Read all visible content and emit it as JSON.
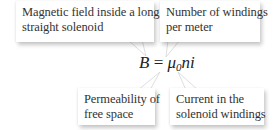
{
  "diagram": {
    "formula": {
      "lhs": "B",
      "equals": " = ",
      "mu": "μ",
      "mu_sub": "0",
      "rest": "ni"
    },
    "callouts": [
      {
        "id": "magnetic-field",
        "lines": [
          "Magnetic field inside a long,",
          "straight solenoid"
        ],
        "points_to": "B"
      },
      {
        "id": "windings-per-meter",
        "lines": [
          "Number of windings",
          "per meter"
        ],
        "points_to": "n"
      },
      {
        "id": "permeability",
        "lines": [
          "Permeability of",
          "free space"
        ],
        "points_to": "μ0"
      },
      {
        "id": "current",
        "lines": [
          "Current in the",
          "solenoid windings"
        ],
        "points_to": "i"
      }
    ],
    "colors": {
      "text": "#333333",
      "box": "#ffffff",
      "shadow": "#bbbbbb"
    }
  }
}
